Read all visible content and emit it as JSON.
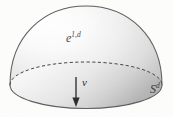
{
  "figure": {
    "kind": "geometric-diagram",
    "background_color": "#fdfdfc",
    "canvas": {
      "width": 173,
      "height": 117
    }
  },
  "labels": {
    "surface": {
      "base": "e",
      "exponent": "1,d",
      "display": "e¹ᵈ",
      "x": 66,
      "y": 32
    },
    "normal_vector": {
      "text": "ν",
      "name": "nu",
      "x": 82,
      "y": 77
    },
    "sphere": {
      "base": "S",
      "exponent": "d",
      "display": "Sᵈ",
      "x": 150,
      "y": 83
    }
  },
  "shapes": {
    "dome": {
      "name": "hemisphere",
      "apex": {
        "x": 86,
        "y": 6
      },
      "left_edge_x": 10,
      "right_edge_x": 163,
      "equator_center": {
        "x": 86,
        "y": 85
      },
      "equator_rx": 76,
      "equator_ry": 23,
      "fill_light": "#ffffff",
      "fill_mid": "#e2e2e2",
      "fill_dark": "#a9a9a9",
      "outline_color": "#5a5a5a"
    },
    "equator_back": {
      "style": "dashed",
      "color": "#4a4a4a",
      "dash": "3,2.2"
    },
    "equator_front": {
      "style": "solid",
      "color": "#5a5a5a"
    },
    "normal_arrow": {
      "x": 76,
      "y_start": 77,
      "y_end": 106,
      "color": "#2b2b2b",
      "head_width": 6,
      "head_height": 8
    }
  },
  "colors": {
    "ink": "#3a3a3a",
    "outline": "#5a5a5a",
    "arrow": "#2b2b2b",
    "paper": "#fdfdfc"
  }
}
